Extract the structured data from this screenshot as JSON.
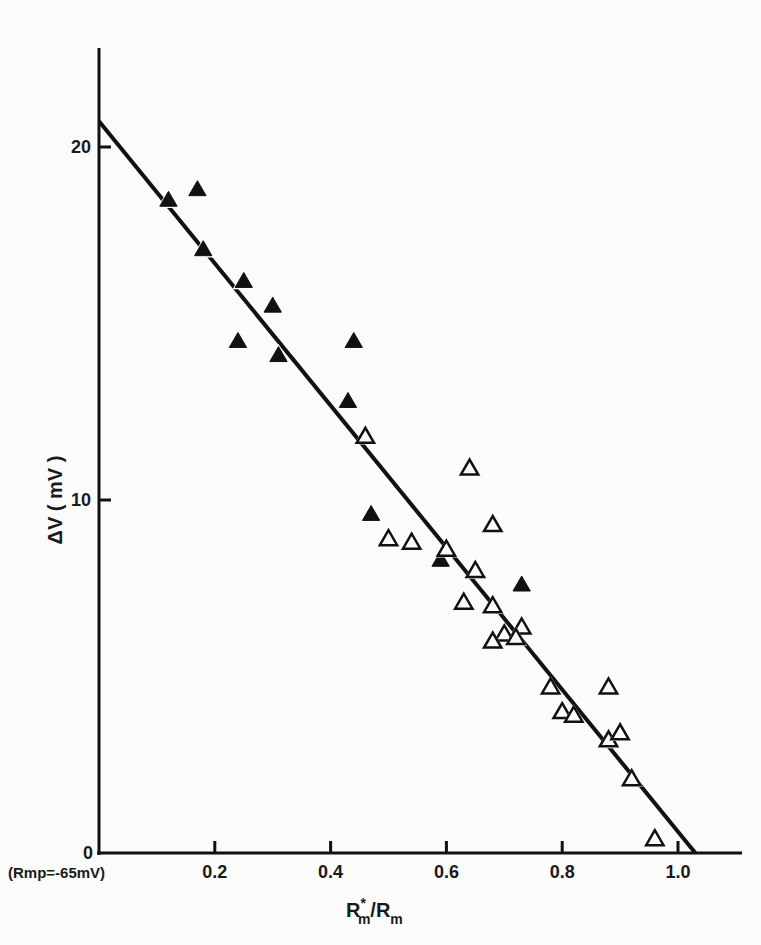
{
  "chart_data": {
    "type": "scatter",
    "title": "",
    "xlabel": "R*m/Rm",
    "xlabel_main": "R",
    "xlabel_sup": "*",
    "xlabel_sub": "m",
    "xlabel_rest": "/R",
    "xlabel_sub2": "m",
    "ylabel": "ΔV ( mV )",
    "xlim": [
      0,
      1.12
    ],
    "ylim": [
      0,
      23
    ],
    "grid": false,
    "legend": null,
    "x_ticks": [
      0.2,
      0.4,
      0.6,
      0.8,
      1.0
    ],
    "x_tick_labels": [
      "0.2",
      "0.4",
      "0.6",
      "0.8",
      "1.0"
    ],
    "y_ticks": [
      0,
      10,
      20
    ],
    "y_tick_labels": [
      "0",
      "10",
      "20"
    ],
    "annotation": "(Rmp=-65mV)",
    "series": [
      {
        "name": "filled triangles",
        "marker": "filled-triangle",
        "x": [
          0.12,
          0.17,
          0.18,
          0.25,
          0.3,
          0.24,
          0.31,
          0.44,
          0.43,
          0.47,
          0.59,
          0.73
        ],
        "y": [
          18.5,
          18.8,
          17.1,
          16.2,
          15.5,
          14.5,
          14.1,
          14.5,
          12.8,
          9.6,
          8.3,
          7.6
        ]
      },
      {
        "name": "open triangles",
        "marker": "open-triangle",
        "x": [
          0.46,
          0.64,
          0.5,
          0.54,
          0.6,
          0.65,
          0.63,
          0.68,
          0.73,
          0.7,
          0.72,
          0.68,
          0.68,
          0.78,
          0.88,
          0.8,
          0.82,
          0.88,
          0.9,
          0.92,
          0.96
        ],
        "y": [
          11.8,
          10.9,
          8.9,
          8.8,
          8.6,
          8.0,
          7.1,
          7.0,
          6.4,
          6.2,
          6.1,
          6.0,
          9.3,
          4.7,
          4.7,
          4.0,
          3.9,
          3.2,
          3.4,
          2.1,
          0.4
        ]
      },
      {
        "name": "regression line",
        "type": "line",
        "x": [
          0,
          1.03
        ],
        "y": [
          20.7,
          0
        ]
      }
    ]
  }
}
